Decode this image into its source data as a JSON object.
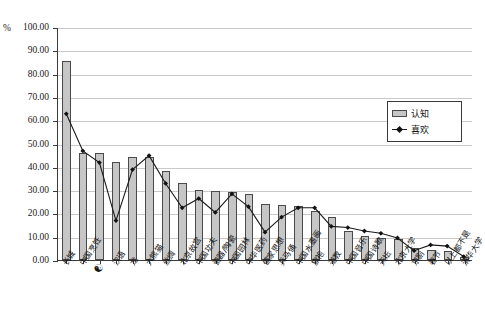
{
  "chart": {
    "type": "bar",
    "pct_symbol": "%",
    "ylabel": "",
    "xlabel": "",
    "title": "",
    "grid": true,
    "legend_position": "top-right"
  },
  "axis": {
    "y_ticks": [
      "100.00",
      "90.00",
      "80.00",
      "70.00",
      "60.00",
      "50.00",
      "40.00",
      "30.00",
      "20.00",
      "10.00",
      "0.00"
    ],
    "ylim": [
      0,
      100
    ],
    "ystep": 10
  },
  "legend": {
    "items": [
      {
        "label": "认知",
        "marker": "bar"
      },
      {
        "label": "喜欢",
        "marker": "line-diamond"
      }
    ]
  },
  "chart_data": {
    "type": "bar",
    "title": "",
    "xlabel": "",
    "ylabel": "%",
    "ylim": [
      0,
      100
    ],
    "ystep": 10,
    "grid": true,
    "legend_position": "top-right",
    "categories": [
      "长城",
      "中国烹饪",
      "☯",
      "汉语",
      "龙",
      "大熊猫",
      "丝绸",
      "北京故宫",
      "中国功夫",
      "瓷器/陶瓷",
      "中国园林",
      "中华医药",
      "儒家思想",
      "兵马俑",
      "中国水墨画",
      "旗袍",
      "道教",
      "中国音乐",
      "中国诗歌",
      "天坛",
      "北京大学",
      "京剧",
      "春节",
      "以上都不是",
      "清华大学"
    ],
    "series": [
      {
        "name": "认知",
        "type": "bar",
        "values": [
          85.5,
          46.0,
          46.0,
          42.0,
          44.0,
          44.0,
          38.0,
          33.0,
          30.0,
          29.5,
          29.0,
          28.5,
          24.0,
          23.5,
          23.0,
          21.0,
          18.5,
          12.5,
          10.5,
          9.5,
          9.0,
          5.0,
          4.5,
          4.0,
          1.5
        ]
      },
      {
        "name": "喜欢",
        "type": "line",
        "values": [
          63.0,
          47.0,
          42.0,
          17.0,
          39.0,
          45.0,
          33.0,
          22.5,
          26.5,
          20.5,
          28.5,
          23.0,
          12.0,
          18.5,
          22.5,
          22.5,
          14.5,
          14.0,
          12.5,
          11.5,
          9.5,
          4.0,
          6.5,
          6.0,
          1.5
        ]
      }
    ]
  }
}
